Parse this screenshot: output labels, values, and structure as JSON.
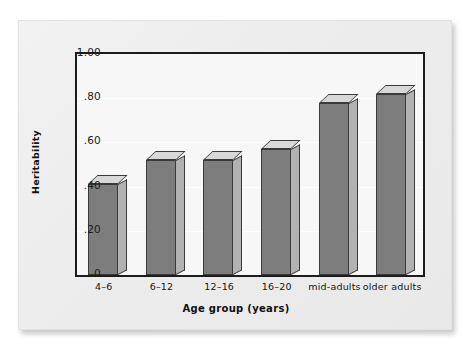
{
  "figure": {
    "y_axis_title": "Heritability",
    "x_axis_title": "Age group (years)"
  },
  "chart_data": {
    "type": "bar",
    "title": "",
    "xlabel": "Age group (years)",
    "ylabel": "Heritability",
    "categories": [
      "4–6",
      "6–12",
      "12–16",
      "16–20",
      "mid-adults",
      "older adults"
    ],
    "values": [
      0.41,
      0.52,
      0.52,
      0.57,
      0.78,
      0.82
    ],
    "ylim": [
      0,
      1.0
    ],
    "ytick_labels": [
      "1.00",
      ".80",
      ".60",
      ".40",
      ".20",
      "0"
    ],
    "ytick_values": [
      1.0,
      0.8,
      0.6,
      0.4,
      0.2,
      0
    ],
    "grid": true,
    "legend": "none",
    "style": "3d-bars",
    "colors": {
      "bar_front": "#7d7d7d",
      "bar_side": "#b2b2b2",
      "bar_top": "#d8d8d8",
      "bar_outline": "#3a3a3a",
      "plot_background": "#f7f7f7",
      "axis": "#1c1c1c",
      "card_background": "#eeeeee",
      "page_background": "#ffffff"
    }
  }
}
